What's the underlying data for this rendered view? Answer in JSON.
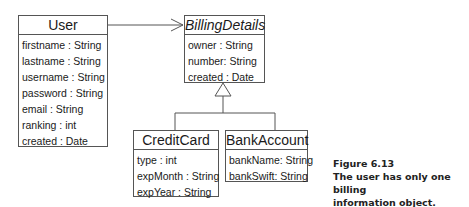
{
  "diagram": {
    "type": "UML class diagram",
    "classes": {
      "user": {
        "name": "User",
        "attributes": [
          "firstname : String",
          "lastname : String",
          "username : String",
          "password : String",
          "email : String",
          "ranking : int",
          "created : Date"
        ]
      },
      "billing": {
        "name": "BillingDetails",
        "abstract": true,
        "attributes": [
          "owner : String",
          "number: String",
          "created : Date"
        ]
      },
      "creditcard": {
        "name": "CreditCard",
        "attributes": [
          "type : int",
          "expMonth : String",
          "expYear : String"
        ]
      },
      "bankaccount": {
        "name": "BankAccount",
        "attributes": [
          "bankName: String",
          "bankSwift: String"
        ]
      }
    },
    "relations": [
      {
        "from": "User",
        "to": "BillingDetails",
        "kind": "directed-association"
      },
      {
        "from": "CreditCard",
        "to": "BillingDetails",
        "kind": "generalization"
      },
      {
        "from": "BankAccount",
        "to": "BillingDetails",
        "kind": "generalization"
      }
    ],
    "colors": {
      "line": "#555555",
      "text": "#1a1a1a"
    }
  },
  "caption": {
    "figure": "Figure 6.13",
    "line1": "The user has only one billing",
    "line2": "information object."
  }
}
